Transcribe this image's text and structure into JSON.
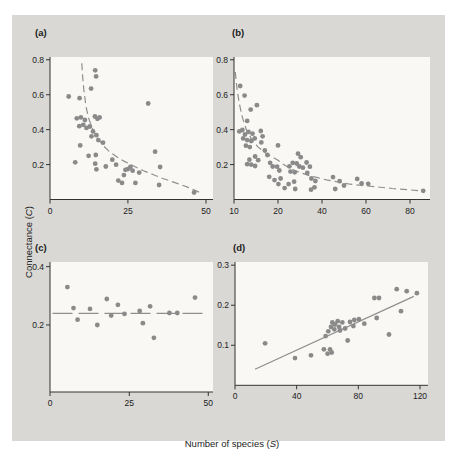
{
  "figure": {
    "y_axis_label": {
      "prefix": "Connectance (",
      "variable": "C",
      "suffix": ")"
    },
    "x_axis_label": {
      "prefix": "Number of species (",
      "variable": "S",
      "suffix": ")"
    },
    "colors": {
      "card_bg": "#d9d8d4",
      "plot_bg": "#f9f8f4",
      "dot": "#8a8a8a",
      "trend": "#8f8f8f",
      "axis": "#333333",
      "text": "#222222"
    }
  },
  "chart_data": [
    {
      "panel": "a",
      "panel_label": "(a)",
      "type": "scatter",
      "xlabel": "Number of species (S)",
      "ylabel": "Connectance (C)",
      "x_ticks": [
        {
          "label": "0",
          "value": 0,
          "frac": 0.0
        },
        {
          "label": "25",
          "value": 25,
          "frac": 0.478
        },
        {
          "label": "50",
          "value": 50,
          "frac": 0.957
        }
      ],
      "y_ticks": [
        {
          "label": "0.2",
          "value": 0.2
        },
        {
          "label": "0.4",
          "value": 0.4
        },
        {
          "label": "0.6",
          "value": 0.6
        },
        {
          "label": "0.8",
          "value": 0.8
        }
      ],
      "y_range_bottom_top": [
        0,
        0.816
      ],
      "points": [
        [
          6,
          0.59
        ],
        [
          9.5,
          0.58
        ],
        [
          14.5,
          0.74
        ],
        [
          14.8,
          0.705
        ],
        [
          13.2,
          0.635
        ],
        [
          31.5,
          0.55
        ],
        [
          8.6,
          0.465
        ],
        [
          9.9,
          0.47
        ],
        [
          11.2,
          0.455
        ],
        [
          14.4,
          0.475
        ],
        [
          15.2,
          0.462
        ],
        [
          15.9,
          0.47
        ],
        [
          9.4,
          0.42
        ],
        [
          10.7,
          0.428
        ],
        [
          11.7,
          0.41
        ],
        [
          12.8,
          0.418
        ],
        [
          13.8,
          0.39
        ],
        [
          14.9,
          0.368
        ],
        [
          13.3,
          0.362
        ],
        [
          15.5,
          0.34
        ],
        [
          17,
          0.325
        ],
        [
          9.7,
          0.31
        ],
        [
          12.4,
          0.25
        ],
        [
          14.7,
          0.255
        ],
        [
          8.1,
          0.213
        ],
        [
          14.5,
          0.205
        ],
        [
          14.9,
          0.173
        ],
        [
          17.9,
          0.189
        ],
        [
          20,
          0.228
        ],
        [
          21.2,
          0.199
        ],
        [
          21.9,
          0.108
        ],
        [
          23.1,
          0.095
        ],
        [
          23.7,
          0.14
        ],
        [
          24.2,
          0.17
        ],
        [
          25,
          0.174
        ],
        [
          25.8,
          0.186
        ],
        [
          26.5,
          0.165
        ],
        [
          27.4,
          0.095
        ],
        [
          28.6,
          0.154
        ],
        [
          33.7,
          0.274
        ],
        [
          35.3,
          0.186
        ],
        [
          35,
          0.083
        ],
        [
          46.2,
          0.04
        ]
      ],
      "trend": {
        "style": "dashed",
        "dash": "7 4",
        "points": [
          [
            10.2,
            0.78
          ],
          [
            10.5,
            0.7
          ],
          [
            10.9,
            0.62
          ],
          [
            11.5,
            0.54
          ],
          [
            12.3,
            0.47
          ],
          [
            13.5,
            0.41
          ],
          [
            15,
            0.36
          ],
          [
            17,
            0.31
          ],
          [
            19,
            0.275
          ],
          [
            21.5,
            0.243
          ],
          [
            24,
            0.217
          ],
          [
            27,
            0.19
          ],
          [
            30,
            0.165
          ],
          [
            33,
            0.143
          ],
          [
            36,
            0.122
          ],
          [
            39,
            0.103
          ],
          [
            42,
            0.085
          ],
          [
            44.5,
            0.068
          ],
          [
            46.5,
            0.052
          ],
          [
            47.8,
            0.042
          ]
        ]
      }
    },
    {
      "panel": "b",
      "panel_label": "(b)",
      "type": "scatter",
      "xlabel": "Number of species (S)",
      "ylabel": "Connectance (C)",
      "x_ticks": [
        {
          "label": "10",
          "value": 10,
          "frac": 0.0
        },
        {
          "label": "20",
          "value": 20,
          "frac": 0.2245
        },
        {
          "label": "40",
          "value": 40,
          "frac": 0.449
        },
        {
          "label": "60",
          "value": 60,
          "frac": 0.6735
        },
        {
          "label": "80",
          "value": 80,
          "frac": 0.898
        }
      ],
      "y_ticks": [
        {
          "label": "0.2",
          "value": 0.2
        },
        {
          "label": "0.4",
          "value": 0.4
        },
        {
          "label": "0.6",
          "value": 0.6
        },
        {
          "label": "0.8",
          "value": 0.8
        }
      ],
      "y_range_bottom_top": [
        0,
        0.816
      ],
      "points": [
        [
          11.4,
          0.65
        ],
        [
          12.4,
          0.595
        ],
        [
          13.8,
          0.515
        ],
        [
          15.2,
          0.54
        ],
        [
          13,
          0.45
        ],
        [
          11.2,
          0.39
        ],
        [
          11.9,
          0.398
        ],
        [
          12.5,
          0.372
        ],
        [
          13.3,
          0.387
        ],
        [
          14.2,
          0.377
        ],
        [
          16.1,
          0.392
        ],
        [
          12.1,
          0.35
        ],
        [
          13,
          0.34
        ],
        [
          13.9,
          0.335
        ],
        [
          14.7,
          0.35
        ],
        [
          16.5,
          0.362
        ],
        [
          16.2,
          0.327
        ],
        [
          12.7,
          0.308
        ],
        [
          13.6,
          0.3
        ],
        [
          20,
          0.31
        ],
        [
          17,
          0.281
        ],
        [
          29.1,
          0.262
        ],
        [
          17.6,
          0.255
        ],
        [
          14.8,
          0.246
        ],
        [
          30.3,
          0.242
        ],
        [
          13.5,
          0.228
        ],
        [
          15.5,
          0.225
        ],
        [
          13,
          0.202
        ],
        [
          13.9,
          0.2
        ],
        [
          18.2,
          0.21
        ],
        [
          26.7,
          0.21
        ],
        [
          33,
          0.212
        ],
        [
          28.5,
          0.206
        ],
        [
          14.8,
          0.192
        ],
        [
          18.8,
          0.189
        ],
        [
          19.8,
          0.188
        ],
        [
          25.2,
          0.19
        ],
        [
          29.7,
          0.189
        ],
        [
          34.5,
          0.188
        ],
        [
          31.3,
          0.182
        ],
        [
          20.6,
          0.166
        ],
        [
          25.7,
          0.16
        ],
        [
          27.6,
          0.156
        ],
        [
          33.3,
          0.152
        ],
        [
          18,
          0.13
        ],
        [
          45,
          0.128
        ],
        [
          21.2,
          0.12
        ],
        [
          35.2,
          0.12
        ],
        [
          56,
          0.118
        ],
        [
          19.2,
          0.111
        ],
        [
          37,
          0.106
        ],
        [
          48,
          0.105
        ],
        [
          58,
          0.092
        ],
        [
          61,
          0.09
        ],
        [
          24.8,
          0.088
        ],
        [
          20.2,
          0.088
        ],
        [
          27.3,
          0.102
        ],
        [
          36.6,
          0.07
        ],
        [
          23,
          0.065
        ],
        [
          27.8,
          0.06
        ],
        [
          35,
          0.056
        ],
        [
          46,
          0.06
        ],
        [
          50,
          0.08
        ],
        [
          86,
          0.05
        ]
      ],
      "trend": {
        "style": "dashed",
        "dash": "7 4",
        "points": [
          [
            10.3,
            0.73
          ],
          [
            10.7,
            0.63
          ],
          [
            11.2,
            0.55
          ],
          [
            11.9,
            0.47
          ],
          [
            12.8,
            0.4
          ],
          [
            14,
            0.345
          ],
          [
            15.5,
            0.3
          ],
          [
            17.5,
            0.26
          ],
          [
            20,
            0.225
          ],
          [
            22.5,
            0.2
          ],
          [
            25,
            0.182
          ],
          [
            28,
            0.165
          ],
          [
            31,
            0.15
          ],
          [
            34,
            0.138
          ],
          [
            38,
            0.125
          ],
          [
            42,
            0.112
          ],
          [
            47,
            0.1
          ],
          [
            52,
            0.09
          ],
          [
            58,
            0.08
          ],
          [
            65,
            0.072
          ],
          [
            72,
            0.063
          ],
          [
            80,
            0.055
          ],
          [
            86,
            0.048
          ]
        ]
      }
    },
    {
      "panel": "c",
      "panel_label": "(c)",
      "type": "scatter",
      "xlabel": "Number of species (S)",
      "ylabel": "Connectance (C)",
      "x_ticks": [
        {
          "label": "0",
          "value": 0,
          "frac": 0.0
        },
        {
          "label": "25",
          "value": 25,
          "frac": 0.4865
        },
        {
          "label": "50",
          "value": 50,
          "frac": 0.971
        }
      ],
      "y_ticks": [
        {
          "label": "0.2",
          "value": 0.2
        },
        {
          "label": "0.4",
          "value": 0.4
        }
      ],
      "y_range_bottom_top": [
        -0.03,
        0.416
      ],
      "points": [
        [
          5.5,
          0.33
        ],
        [
          7.4,
          0.258
        ],
        [
          8.7,
          0.218
        ],
        [
          12.6,
          0.255
        ],
        [
          14.9,
          0.2
        ],
        [
          17.9,
          0.289
        ],
        [
          19.3,
          0.232
        ],
        [
          21.4,
          0.269
        ],
        [
          23.5,
          0.238
        ],
        [
          28.3,
          0.248
        ],
        [
          29.3,
          0.206
        ],
        [
          31.6,
          0.264
        ],
        [
          32.8,
          0.156
        ],
        [
          37.7,
          0.241
        ],
        [
          40.2,
          0.241
        ],
        [
          45.8,
          0.294
        ]
      ],
      "trend": {
        "style": "dashed",
        "dash": "20 6",
        "points": [
          [
            0.8,
            0.24
          ],
          [
            48.5,
            0.24
          ]
        ]
      }
    },
    {
      "panel": "d",
      "panel_label": "(d)",
      "type": "scatter",
      "xlabel": "Number of species (S)",
      "ylabel": "Connectance (C)",
      "x_ticks": [
        {
          "label": "0",
          "value": 0,
          "frac": 0.0
        },
        {
          "label": "40",
          "value": 40,
          "frac": 0.3195
        },
        {
          "label": "80",
          "value": 80,
          "frac": 0.639
        },
        {
          "label": "120",
          "value": 120,
          "frac": 0.9585
        }
      ],
      "y_ticks": [
        {
          "label": "0.1",
          "value": 0.1
        },
        {
          "label": "0.2",
          "value": 0.2
        },
        {
          "label": "0.3",
          "value": 0.3
        }
      ],
      "y_range_bottom_top": [
        0,
        0.308
      ],
      "points": [
        [
          19.5,
          0.105
        ],
        [
          38.9,
          0.068
        ],
        [
          49.3,
          0.075
        ],
        [
          57.7,
          0.09
        ],
        [
          60.1,
          0.079
        ],
        [
          61.6,
          0.09
        ],
        [
          62.7,
          0.082
        ],
        [
          58.8,
          0.123
        ],
        [
          60.5,
          0.135
        ],
        [
          62.3,
          0.146
        ],
        [
          63.1,
          0.157
        ],
        [
          64.4,
          0.14
        ],
        [
          64.9,
          0.152
        ],
        [
          66.6,
          0.16
        ],
        [
          67.5,
          0.146
        ],
        [
          68.1,
          0.137
        ],
        [
          69.6,
          0.157
        ],
        [
          71.4,
          0.142
        ],
        [
          73.1,
          0.112
        ],
        [
          74.6,
          0.158
        ],
        [
          76.8,
          0.148
        ],
        [
          77.4,
          0.163
        ],
        [
          80.4,
          0.165
        ],
        [
          83.9,
          0.154
        ],
        [
          90.4,
          0.218
        ],
        [
          93.4,
          0.218
        ],
        [
          91.9,
          0.168
        ],
        [
          99.9,
          0.127
        ],
        [
          104.9,
          0.24
        ],
        [
          107.7,
          0.185
        ],
        [
          111.4,
          0.235
        ],
        [
          118,
          0.23
        ]
      ],
      "trend": {
        "style": "solid",
        "dash": "",
        "points": [
          [
            13,
            0.04
          ],
          [
            116,
            0.222
          ]
        ]
      }
    }
  ]
}
